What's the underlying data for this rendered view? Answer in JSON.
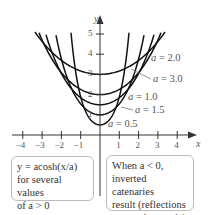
{
  "chart_data": {
    "type": "line",
    "title": "",
    "xlabel": "x",
    "ylabel": "y",
    "xlim": [
      -4.5,
      4.6
    ],
    "ylim": [
      -1.5,
      5.8
    ],
    "x_ticks": [
      "−4",
      "−3",
      "−2",
      "−1",
      "1",
      "2",
      "3",
      "4"
    ],
    "y_ticks": [
      "1",
      "2",
      "3",
      "4",
      "5"
    ],
    "function": "y = a cosh(x/a)",
    "series": [
      {
        "name": "a = 0.5",
        "a": 0.5
      },
      {
        "name": "a = 1.0",
        "a": 1.0
      },
      {
        "name": "a = 1.5",
        "a": 1.5
      },
      {
        "name": "a = 2.0",
        "a": 2.0
      },
      {
        "name": "a = 3.0",
        "a": 3.0
      }
    ],
    "grid": false,
    "legend_position": "inline labels right"
  },
  "labels": {
    "a20": "a = 2.0",
    "a30": "a = 3.0",
    "a10": "a = 1.0",
    "a15": "a = 1.5",
    "a05": "a = 0.5",
    "x_axis": "x",
    "y_axis": "y"
  },
  "ticks": {
    "x": [
      "−4",
      "−3",
      "−2",
      "−1",
      "1",
      "2",
      "3",
      "4"
    ],
    "y": [
      "5",
      "4",
      "3",
      "2",
      "1"
    ]
  },
  "notes": {
    "left_line1": "y = acosh(x/a)",
    "left_line2": "for several values",
    "left_line3": "of a > 0",
    "right_line1": "When a < 0,",
    "right_line2": "inverted catenaries",
    "right_line3": "result (reflections",
    "right_line4": "across the x-axis)"
  }
}
